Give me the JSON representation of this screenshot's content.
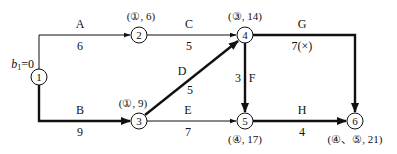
{
  "diagram": {
    "type": "activity-on-arrow network (label method)",
    "colors": {
      "line": "#111111",
      "background": "#ffffff"
    },
    "start_label": {
      "text_b": "b",
      "text_sub": "1",
      "text_eq": "=0"
    },
    "nodes": [
      {
        "id": "1",
        "label": "1",
        "cx": 39,
        "cy": 77,
        "annotation": ""
      },
      {
        "id": "2",
        "label": "2",
        "cx": 139,
        "cy": 35,
        "annotation": "(①, 6)"
      },
      {
        "id": "3",
        "label": "3",
        "cx": 139,
        "cy": 121,
        "annotation": "(①, 9)"
      },
      {
        "id": "4",
        "label": "4",
        "cx": 245,
        "cy": 35,
        "annotation": "(③, 14)"
      },
      {
        "id": "5",
        "label": "5",
        "cx": 245,
        "cy": 121,
        "annotation": "(④, 17)"
      },
      {
        "id": "6",
        "label": "6",
        "cx": 355,
        "cy": 121,
        "annotation": "(④、⑤, 21)"
      }
    ],
    "activities": [
      {
        "name": "A",
        "from": "1",
        "to": "2",
        "duration": "6",
        "critical": false
      },
      {
        "name": "B",
        "from": "1",
        "to": "3",
        "duration": "9",
        "critical": true
      },
      {
        "name": "C",
        "from": "2",
        "to": "4",
        "duration": "5",
        "critical": false
      },
      {
        "name": "D",
        "from": "3",
        "to": "4",
        "duration": "5",
        "critical": true
      },
      {
        "name": "E",
        "from": "3",
        "to": "5",
        "duration": "7",
        "critical": false
      },
      {
        "name": "F",
        "from": "4",
        "to": "5",
        "duration": "3",
        "critical": true
      },
      {
        "name": "G",
        "from": "4",
        "to": "6",
        "duration": "7(×)",
        "critical": true
      },
      {
        "name": "H",
        "from": "5",
        "to": "6",
        "duration": "4",
        "critical": true
      }
    ]
  }
}
